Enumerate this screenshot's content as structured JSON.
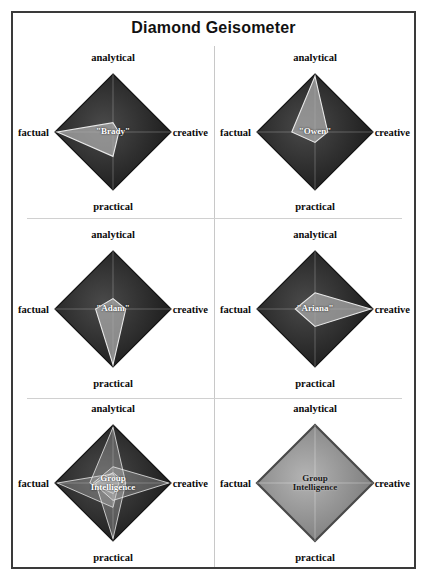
{
  "title": "Diamond Geisometer",
  "colors": {
    "frame_border": "#3a3a3a",
    "divider": "#c8c8c8",
    "diamond_dark": "#2b2b2b",
    "diamond_light": "#8d8d8d",
    "inner_fill": "#9a9a9a",
    "inner_stroke": "#e8e8e8",
    "axis_line": "#cfcfcf",
    "label_text": "#0b0b0b"
  },
  "axes": {
    "top": "analytical",
    "bottom": "practical",
    "left": "factual",
    "right": "creative"
  },
  "chart_data": {
    "type": "radar",
    "title": "Diamond Geisometer",
    "axis_order": [
      "analytical",
      "creative",
      "practical",
      "factual"
    ],
    "axis_max": 1.0,
    "grid": false,
    "legend": "none",
    "panels": [
      {
        "index": 1,
        "label": "\"Brady\"",
        "label_lines": [
          "\"Brady\""
        ],
        "values": {
          "analytical": 0.16,
          "creative": 0.1,
          "practical": 0.42,
          "factual": 0.96
        },
        "shape": "leftward-kite"
      },
      {
        "index": 2,
        "label": "\"Owen\"",
        "label_lines": [
          "\"Owen\""
        ],
        "values": {
          "analytical": 0.96,
          "creative": 0.22,
          "practical": 0.18,
          "factual": 0.4
        },
        "shape": "upward-kite"
      },
      {
        "index": 3,
        "label": "\"Adam\"",
        "label_lines": [
          "\"Adam\""
        ],
        "values": {
          "analytical": 0.18,
          "creative": 0.22,
          "practical": 0.96,
          "factual": 0.3
        },
        "shape": "downward-kite"
      },
      {
        "index": 4,
        "label": "\"Ariana\"",
        "label_lines": [
          "\"Ariana\""
        ],
        "values": {
          "analytical": 0.28,
          "creative": 0.96,
          "practical": 0.3,
          "factual": 0.34
        },
        "shape": "rightward-kite"
      },
      {
        "index": 5,
        "label": "Group\nIntelligence",
        "label_lines": [
          "Group",
          "Intelligence"
        ],
        "values": {
          "analytical": 0.96,
          "creative": 0.96,
          "practical": 0.96,
          "factual": 0.96
        },
        "shape": "overlaid-individuals",
        "overlays": [
          {
            "analytical": 0.16,
            "creative": 0.1,
            "practical": 0.42,
            "factual": 0.96
          },
          {
            "analytical": 0.96,
            "creative": 0.22,
            "practical": 0.18,
            "factual": 0.4
          },
          {
            "analytical": 0.18,
            "creative": 0.22,
            "practical": 0.96,
            "factual": 0.3
          },
          {
            "analytical": 0.28,
            "creative": 0.96,
            "practical": 0.3,
            "factual": 0.34
          }
        ]
      },
      {
        "index": 6,
        "label": "Group\nIntelligence",
        "label_lines": [
          "Group",
          "Intelligence"
        ],
        "values": {
          "analytical": 1.0,
          "creative": 1.0,
          "practical": 1.0,
          "factual": 1.0
        },
        "shape": "full-diamond"
      }
    ]
  }
}
